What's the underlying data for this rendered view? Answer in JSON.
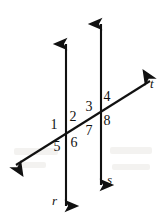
{
  "figure": {
    "background_color": "#ffffff",
    "ink_color": "#111111",
    "width": 164,
    "height": 222
  },
  "lines": [
    {
      "id": "line-r",
      "label": "r",
      "kind": "vertical-parallel-line",
      "arrowheads": "both",
      "x": 66,
      "y_top": 44,
      "y_bottom": 206,
      "label_x": 52,
      "label_y": 201
    },
    {
      "id": "line-s",
      "label": "s",
      "kind": "vertical-parallel-line",
      "arrowheads": "both",
      "x": 101,
      "y_top": 24,
      "y_bottom": 185,
      "label_x": 107,
      "label_y": 180
    },
    {
      "id": "line-t",
      "label": "t",
      "kind": "transversal-line",
      "arrowheads": "both",
      "x_start": 16,
      "y_start": 165,
      "x_end": 150,
      "y_end": 81,
      "label_x": 151,
      "label_y": 84
    }
  ],
  "intersections": [
    {
      "id": "intersection-r-t",
      "lines": [
        "r",
        "t"
      ],
      "x": 66,
      "y": 134
    },
    {
      "id": "intersection-s-t",
      "lines": [
        "s",
        "t"
      ],
      "x": 101,
      "y": 112
    }
  ],
  "angles": [
    {
      "number": "1",
      "intersection": "intersection-r-t",
      "position": "left",
      "x": 51,
      "y": 118
    },
    {
      "number": "2",
      "intersection": "intersection-r-t",
      "position": "top-right",
      "x": 70,
      "y": 110
    },
    {
      "number": "3",
      "intersection": "intersection-s-t",
      "position": "top-left",
      "x": 85,
      "y": 100
    },
    {
      "number": "4",
      "intersection": "intersection-s-t",
      "position": "top-right",
      "x": 104,
      "y": 90
    },
    {
      "number": "5",
      "intersection": "intersection-r-t",
      "position": "bottom-left",
      "x": 54,
      "y": 140
    },
    {
      "number": "6",
      "intersection": "intersection-r-t",
      "position": "bottom-right",
      "x": 70,
      "y": 136
    },
    {
      "number": "7",
      "intersection": "intersection-s-t",
      "position": "bottom-left",
      "x": 85,
      "y": 124
    },
    {
      "number": "8",
      "intersection": "intersection-s-t",
      "position": "bottom-right",
      "x": 104,
      "y": 114
    }
  ]
}
